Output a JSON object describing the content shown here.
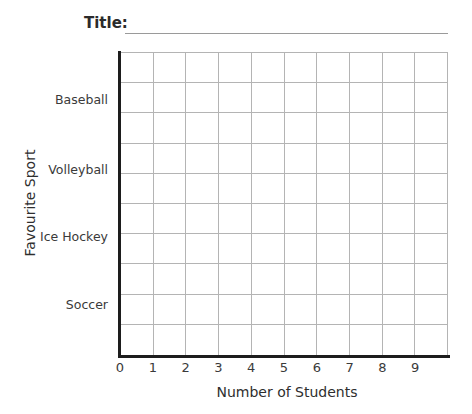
{
  "title": {
    "label": "Title:",
    "value": "",
    "placeholder": ""
  },
  "chart_data": {
    "type": "bar",
    "orientation": "horizontal",
    "title": "",
    "xlabel": "Number of Students",
    "ylabel": "Favourite Sport",
    "categories": [
      "Baseball",
      "Volleyball",
      "Ice Hockey",
      "Soccer"
    ],
    "values": [
      null,
      null,
      null,
      null
    ],
    "x_ticks": [
      "0",
      "1",
      "2",
      "3",
      "4",
      "5",
      "6",
      "7",
      "8",
      "9"
    ],
    "xlim": [
      0,
      10
    ],
    "grid": true,
    "grid_columns": 10,
    "grid_rows": 10,
    "legend": null,
    "note": "Blank template worksheet — no bars plotted",
    "colors": {
      "grid_line": "#b4b4b4",
      "axis_line": "#1d1d1d",
      "text": "#3a3a3a",
      "background": "#ffffff"
    }
  },
  "axes": {
    "y_title": "Favourite Sport",
    "x_title": "Number of Students"
  }
}
